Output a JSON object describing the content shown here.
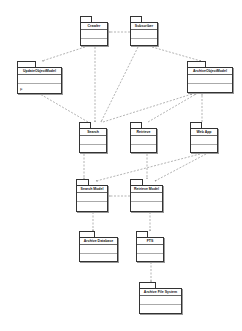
{
  "diagram": {
    "type": "uml-package-dependency",
    "packages": [
      {
        "id": "crawler",
        "label": "Crawler",
        "x": 80,
        "y": 16,
        "w": 28,
        "h": 30
      },
      {
        "id": "subscriber",
        "label": "Subscriber",
        "x": 130,
        "y": 16,
        "w": 28,
        "h": 30
      },
      {
        "id": "update-object-model",
        "label": "UpdateObjectModel",
        "x": 17,
        "y": 61,
        "w": 45,
        "h": 33
      },
      {
        "id": "archive-object-model",
        "label": "ArchiveObjectModel",
        "x": 187,
        "y": 61,
        "w": 46,
        "h": 32
      },
      {
        "id": "search",
        "label": "Search",
        "x": 79,
        "y": 122,
        "w": 28,
        "h": 31
      },
      {
        "id": "retrieve",
        "label": "Retrieve",
        "x": 130,
        "y": 122,
        "w": 27,
        "h": 31
      },
      {
        "id": "web-app",
        "label": "Web App",
        "x": 190,
        "y": 122,
        "w": 28,
        "h": 31
      },
      {
        "id": "search-model",
        "label": "Search Model",
        "x": 76,
        "y": 179,
        "w": 32,
        "h": 33
      },
      {
        "id": "retrieve-model",
        "label": "Retrieve Model",
        "x": 130,
        "y": 179,
        "w": 33,
        "h": 33
      },
      {
        "id": "archive-database",
        "label": "Archive Database",
        "x": 79,
        "y": 231,
        "w": 39,
        "h": 31
      },
      {
        "id": "fts",
        "label": "FTS",
        "x": 136,
        "y": 231,
        "w": 28,
        "h": 31
      },
      {
        "id": "archive-file-system",
        "label": "Archive File System",
        "x": 139,
        "y": 282,
        "w": 43,
        "h": 32
      }
    ],
    "update_object_model_marker": "F",
    "dependencies": [
      {
        "from": "subscriber",
        "to": "crawler"
      },
      {
        "from": "crawler",
        "to": "update-object-model"
      },
      {
        "from": "crawler",
        "to": "search"
      },
      {
        "from": "subscriber",
        "to": "search"
      },
      {
        "from": "subscriber",
        "to": "archive-object-model"
      },
      {
        "from": "search",
        "to": "update-object-model"
      },
      {
        "from": "search",
        "to": "archive-object-model"
      },
      {
        "from": "retrieve",
        "to": "archive-object-model"
      },
      {
        "from": "web-app",
        "to": "archive-object-model"
      },
      {
        "from": "search",
        "to": "search-model"
      },
      {
        "from": "retrieve",
        "to": "retrieve-model"
      },
      {
        "from": "web-app",
        "to": "search-model"
      },
      {
        "from": "web-app",
        "to": "retrieve-model"
      },
      {
        "from": "retrieve-model",
        "to": "search-model"
      },
      {
        "from": "search-model",
        "to": "archive-database"
      },
      {
        "from": "retrieve-model",
        "to": "fts"
      },
      {
        "from": "fts",
        "to": "archive-file-system"
      }
    ],
    "colors": {
      "line": "#555555",
      "box": "#333333",
      "background": "#ffffff"
    }
  }
}
